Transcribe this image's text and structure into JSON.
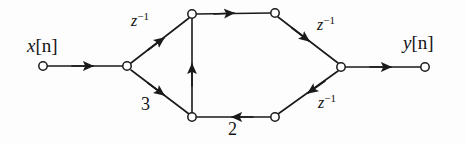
{
  "figure": {
    "type": "signal-flow-graph",
    "background_color": "#fdfdfd",
    "stroke_color": "#1a1a1a",
    "node_fill_color": "#ffffff",
    "labels": {
      "input": "x[n]",
      "input_var": "x",
      "input_index": "[n]",
      "output": "y[n]",
      "output_var": "y",
      "output_index": "[n]",
      "delay_top_left": "z",
      "delay_top_left_exp": "−1",
      "delay_top_right": "z",
      "delay_top_right_exp": "−1",
      "delay_bottom_right": "z",
      "delay_bottom_right_exp": "−1",
      "gain_three": "3",
      "gain_two": "2"
    },
    "nodes": [
      {
        "id": "x-input",
        "name": "input-node",
        "x": 43,
        "y": 66,
        "r": 4.2
      },
      {
        "id": "junction-left",
        "name": "left-junction-node",
        "x": 127,
        "y": 66,
        "r": 4.2
      },
      {
        "id": "top-left",
        "name": "top-left-node",
        "x": 192,
        "y": 14,
        "r": 4.2
      },
      {
        "id": "top-right",
        "name": "top-right-node",
        "x": 275,
        "y": 13,
        "r": 4.2
      },
      {
        "id": "bottom-left",
        "name": "bottom-left-node",
        "x": 192,
        "y": 117,
        "r": 4.2
      },
      {
        "id": "bottom-right",
        "name": "bottom-right-node",
        "x": 275,
        "y": 117,
        "r": 4.2
      },
      {
        "id": "junction-right",
        "name": "right-junction-node",
        "x": 341,
        "y": 67,
        "r": 4.2
      },
      {
        "id": "y-output",
        "name": "output-node",
        "x": 425,
        "y": 67,
        "r": 4.2
      }
    ],
    "edges": [
      {
        "id": "e-input",
        "from": "x-input",
        "to": "junction-left",
        "gain": "",
        "direction": "right"
      },
      {
        "id": "e-delay-tl",
        "from": "junction-left",
        "to": "top-left",
        "gain": "z^-1",
        "direction": "up-right"
      },
      {
        "id": "e-gain-3",
        "from": "junction-left",
        "to": "bottom-left",
        "gain": "3",
        "direction": "down-right"
      },
      {
        "id": "e-top",
        "from": "top-left",
        "to": "top-right",
        "gain": "",
        "direction": "right"
      },
      {
        "id": "e-feedback-up",
        "from": "bottom-left",
        "to": "top-left",
        "gain": "",
        "direction": "up"
      },
      {
        "id": "e-delay-tr",
        "from": "top-right",
        "to": "junction-right",
        "gain": "z^-1",
        "direction": "down-right"
      },
      {
        "id": "e-delay-br",
        "from": "junction-right",
        "to": "bottom-right",
        "gain": "z^-1",
        "direction": "down-left"
      },
      {
        "id": "e-gain-2",
        "from": "bottom-right",
        "to": "bottom-left",
        "gain": "2",
        "direction": "left"
      },
      {
        "id": "e-output",
        "from": "junction-right",
        "to": "y-output",
        "gain": "",
        "direction": "right"
      }
    ],
    "label_positions": {
      "input": {
        "x": 50,
        "y": 46
      },
      "output": {
        "x": 425,
        "y": 43
      },
      "delay_top_left": {
        "x": 144,
        "y": 22
      },
      "delay_top_right": {
        "x": 330,
        "y": 26
      },
      "delay_bottom_right": {
        "x": 331,
        "y": 104
      },
      "gain_three": {
        "x": 147,
        "y": 106
      },
      "gain_two": {
        "x": 233,
        "y": 130
      }
    }
  }
}
